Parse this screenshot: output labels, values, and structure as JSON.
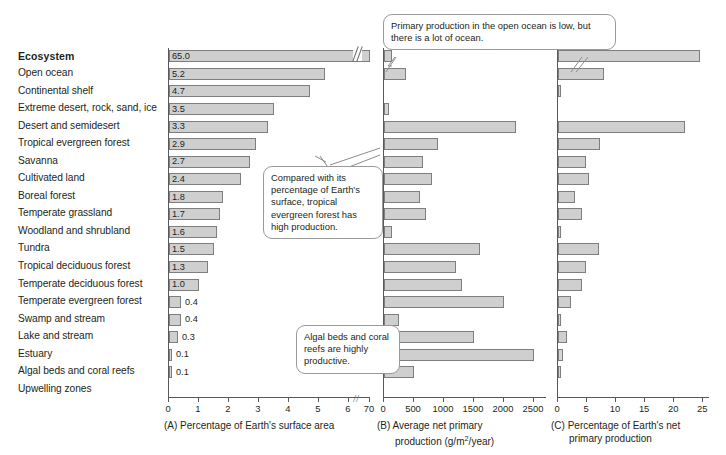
{
  "header": {
    "ecosystem_label": "Ecosystem"
  },
  "ecosystems": [
    "Open ocean",
    "Continental shelf",
    "Extreme desert, rock, sand, ice",
    "Desert and semidesert",
    "Tropical evergreen forest",
    "Savanna",
    "Cultivated land",
    "Boreal forest",
    "Temperate grassland",
    "Woodland and shrubland",
    "Tundra",
    "Tropical deciduous forest",
    "Temperate deciduous forest",
    "Temperate evergreen forest",
    "Swamp and stream",
    "Lake and stream",
    "Estuary",
    "Algal beds and coral reefs",
    "Upwelling zones"
  ],
  "callouts": [
    {
      "id": "callout-open-ocean",
      "text": "Primary production in the open ocean is low, but there is a lot of ocean."
    },
    {
      "id": "callout-tropical-evergreen",
      "text": "Compared with its percentage of Earth's surface, tropical evergreen forest has high production."
    },
    {
      "id": "callout-algal-beds",
      "text": "Algal beds and coral reefs are highly productive."
    }
  ],
  "chart_data": [
    {
      "type": "bar",
      "panel": "A",
      "title": "(A) Percentage of Earth's surface area",
      "xlabel": "Percentage of Earth's surface area",
      "ylabel": "Ecosystem",
      "orientation": "horizontal",
      "grid": false,
      "axis_break": {
        "after": 6,
        "resumes_at": 70,
        "symbol": "//"
      },
      "xlim": [
        0,
        7
      ],
      "xticks": [
        0,
        1,
        2,
        3,
        4,
        5,
        6,
        70
      ],
      "categories": [
        "Open ocean",
        "Continental shelf",
        "Extreme desert, rock, sand, ice",
        "Desert and semidesert",
        "Tropical evergreen forest",
        "Savanna",
        "Cultivated land",
        "Boreal forest",
        "Temperate grassland",
        "Woodland and shrubland",
        "Tundra",
        "Tropical deciduous forest",
        "Temperate deciduous forest",
        "Temperate evergreen forest",
        "Swamp and stream",
        "Lake and stream",
        "Estuary",
        "Algal beds and coral reefs",
        "Upwelling zones"
      ],
      "values": [
        65.0,
        5.2,
        4.7,
        3.5,
        3.3,
        2.9,
        2.7,
        2.4,
        1.8,
        1.7,
        1.6,
        1.5,
        1.3,
        1.0,
        0.4,
        0.4,
        0.3,
        0.1,
        0.1
      ],
      "data_labels": [
        "65.0",
        "5.2",
        "4.7",
        "3.5",
        "3.3",
        "2.9",
        "2.7",
        "2.4",
        "1.8",
        "1.7",
        "1.6",
        "1.5",
        "1.3",
        "1.0",
        "0.4",
        "0.4",
        "0.3",
        "0.1",
        "0.1"
      ]
    },
    {
      "type": "bar",
      "panel": "B",
      "title": "(B) Average net primary production (g/m2/year)",
      "xlabel": "Average net primary production (g/m2/year)",
      "ylabel": "Ecosystem",
      "orientation": "horizontal",
      "grid": false,
      "xlim": [
        0,
        2700
      ],
      "xticks": [
        0,
        500,
        1000,
        1500,
        2000,
        2500
      ],
      "categories": [
        "Open ocean",
        "Continental shelf",
        "Extreme desert, rock, sand, ice",
        "Desert and semidesert",
        "Tropical evergreen forest",
        "Savanna",
        "Cultivated land",
        "Boreal forest",
        "Temperate grassland",
        "Woodland and shrubland",
        "Tundra",
        "Tropical deciduous forest",
        "Temperate deciduous forest",
        "Temperate evergreen forest",
        "Swamp and stream",
        "Lake and stream",
        "Estuary",
        "Algal beds and coral reefs",
        "Upwelling zones"
      ],
      "values": [
        125,
        360,
        3,
        90,
        2200,
        900,
        650,
        800,
        600,
        700,
        140,
        1600,
        1200,
        1300,
        2000,
        250,
        1500,
        2500,
        500
      ]
    },
    {
      "type": "bar",
      "panel": "C",
      "title": "(C) Percentage of Earth's net primary production",
      "xlabel": "Percentage of Earth's net primary production",
      "ylabel": "Ecosystem",
      "orientation": "horizontal",
      "grid": false,
      "xlim": [
        0,
        26
      ],
      "xticks": [
        0,
        5,
        10,
        15,
        20,
        25
      ],
      "categories": [
        "Open ocean",
        "Continental shelf",
        "Extreme desert, rock, sand, ice",
        "Desert and semidesert",
        "Tropical evergreen forest",
        "Savanna",
        "Cultivated land",
        "Boreal forest",
        "Temperate grassland",
        "Woodland and shrubland",
        "Tundra",
        "Tropical deciduous forest",
        "Temperate deciduous forest",
        "Temperate evergreen forest",
        "Swamp and stream",
        "Lake and stream",
        "Estuary",
        "Algal beds and coral reefs",
        "Upwelling zones"
      ],
      "values": [
        24.4,
        7.9,
        0.1,
        0.0,
        21.9,
        7.3,
        4.9,
        5.4,
        2.9,
        4.1,
        0.6,
        7.1,
        4.9,
        4.2,
        2.3,
        0.4,
        1.5,
        0.9,
        0.2
      ]
    }
  ],
  "captions": {
    "a_line1": "(A) Percentage of Earth's surface area",
    "b_line1": "(B) Average net primary",
    "b_line2_pre": "production (g/m",
    "b_line2_sup": "2",
    "b_line2_post": "/year)",
    "c_line1": "(C) Percentage of Earth's net",
    "c_line2": "primary production"
  }
}
